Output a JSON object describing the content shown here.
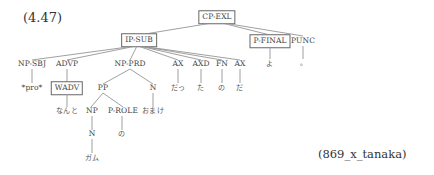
{
  "example_number": "(4.47)",
  "source_id": "(869_x_tanaka)",
  "tree": {
    "root": "CP-EXL",
    "nodes": {
      "cp_exl": "CP-EXL",
      "ip_sub": "IP-SUB",
      "p_final": "P-FINAL",
      "punc": "PUNC",
      "np_sbj": "NP-SBJ",
      "advp": "ADVP",
      "np_prd": "NP-PRD",
      "ax1": "AX",
      "axd": "AXD",
      "fn": "FN",
      "ax2": "AX",
      "pro": "*pro*",
      "wadv": "WADV",
      "pp": "PP",
      "n_omake": "N",
      "np": "NP",
      "p_role": "P-ROLE",
      "n_gum": "N"
    },
    "leaves": {
      "yo": "よ",
      "period": "。",
      "datt": "だっ",
      "ta": "た",
      "no_fn": "の",
      "da": "だ",
      "nanto": "なんと",
      "omake": "おまけ",
      "no_prole": "の",
      "gamu": "ガム"
    }
  }
}
